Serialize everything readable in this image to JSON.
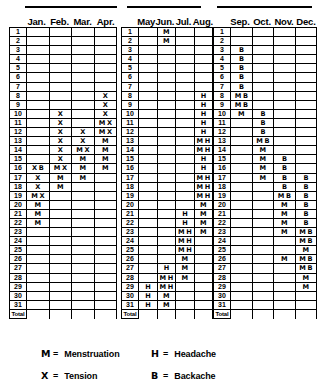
{
  "chart_data": {
    "type": "table",
    "xlabel": "Month",
    "ylabel": "Day of month",
    "grid": true,
    "legend_position": "bottom",
    "row_label_header": "",
    "total_row_label": "Total",
    "day_numbers": [
      "1",
      "2",
      "3",
      "4",
      "5",
      "6",
      "7",
      "8",
      "9",
      "10",
      "11",
      "12",
      "13",
      "14",
      "15",
      "16",
      "17",
      "18",
      "19",
      "20",
      "21",
      "22",
      "23",
      "24",
      "25",
      "26",
      "27",
      "28",
      "29",
      "30",
      "31"
    ],
    "symbols": {
      "menstruation": "M",
      "tension": "X",
      "headache": "H",
      "backache": "B"
    },
    "groups": [
      {
        "id": "group-jan-apr",
        "categories": [
          "Jan.",
          "Feb.",
          "Mar.",
          "Apr."
        ],
        "cells": [
          [
            "",
            "",
            "",
            ""
          ],
          [
            "",
            "",
            "",
            ""
          ],
          [
            "",
            "",
            "",
            ""
          ],
          [
            "",
            "",
            "",
            ""
          ],
          [
            "",
            "",
            "",
            ""
          ],
          [
            "",
            "",
            "",
            ""
          ],
          [
            "",
            "",
            "",
            ""
          ],
          [
            "",
            "",
            "",
            "X"
          ],
          [
            "",
            "",
            "",
            "X"
          ],
          [
            "",
            "X",
            "",
            "X"
          ],
          [
            "",
            "X",
            "",
            "M X"
          ],
          [
            "",
            "X",
            "X",
            "M X"
          ],
          [
            "",
            "X",
            "X",
            "M"
          ],
          [
            "",
            "X",
            "M X",
            "M"
          ],
          [
            "",
            "X",
            "M",
            "M"
          ],
          [
            "X B",
            "M X",
            "M",
            "M"
          ],
          [
            "X",
            "M",
            "M",
            ""
          ],
          [
            "X",
            "M",
            "",
            ""
          ],
          [
            "M X",
            "",
            "",
            ""
          ],
          [
            "M",
            "",
            "",
            ""
          ],
          [
            "M",
            "",
            "",
            ""
          ],
          [
            "M",
            "",
            "",
            ""
          ],
          [
            "",
            "",
            "",
            ""
          ],
          [
            "",
            "",
            "",
            ""
          ],
          [
            "",
            "",
            "",
            ""
          ],
          [
            "",
            "",
            "",
            ""
          ],
          [
            "",
            "",
            "",
            ""
          ],
          [
            "",
            "",
            "",
            ""
          ],
          [
            "",
            "",
            "",
            ""
          ],
          [
            "",
            "",
            "",
            ""
          ],
          [
            "",
            "",
            "",
            ""
          ]
        ],
        "totals": [
          "",
          "",
          "",
          ""
        ]
      },
      {
        "id": "group-may-aug",
        "categories": [
          "May",
          "Jun.",
          "Jul.",
          "Aug."
        ],
        "cells": [
          [
            "",
            "M",
            "",
            ""
          ],
          [
            "",
            "M",
            "",
            ""
          ],
          [
            "",
            "",
            "",
            ""
          ],
          [
            "",
            "",
            "",
            ""
          ],
          [
            "",
            "",
            "",
            ""
          ],
          [
            "",
            "",
            "",
            ""
          ],
          [
            "",
            "",
            "",
            ""
          ],
          [
            "",
            "",
            "",
            "H"
          ],
          [
            "",
            "",
            "",
            "H"
          ],
          [
            "",
            "",
            "",
            "H"
          ],
          [
            "",
            "",
            "",
            "H"
          ],
          [
            "",
            "",
            "",
            "H"
          ],
          [
            "",
            "",
            "",
            "M H"
          ],
          [
            "",
            "",
            "",
            "M H"
          ],
          [
            "",
            "",
            "",
            "H"
          ],
          [
            "",
            "",
            "",
            "H"
          ],
          [
            "",
            "",
            "",
            "M H"
          ],
          [
            "",
            "",
            "",
            "M H"
          ],
          [
            "",
            "",
            "",
            "M H"
          ],
          [
            "",
            "",
            "",
            "M"
          ],
          [
            "",
            "",
            "H",
            "M"
          ],
          [
            "",
            "",
            "H",
            "M"
          ],
          [
            "",
            "",
            "M H",
            "M"
          ],
          [
            "",
            "",
            "M H",
            ""
          ],
          [
            "",
            "",
            "M H",
            ""
          ],
          [
            "",
            "",
            "M",
            ""
          ],
          [
            "",
            "H",
            "M",
            ""
          ],
          [
            "",
            "M H",
            "M",
            ""
          ],
          [
            "H",
            "M H",
            "",
            ""
          ],
          [
            "H",
            "M",
            "",
            ""
          ],
          [
            "H",
            "M",
            "",
            ""
          ]
        ],
        "totals": [
          "",
          "",
          "",
          ""
        ]
      },
      {
        "id": "group-sep-dec",
        "categories": [
          "Sep.",
          "Oct.",
          "Nov.",
          "Dec."
        ],
        "cells": [
          [
            "",
            "",
            "",
            ""
          ],
          [
            "",
            "",
            "",
            ""
          ],
          [
            "B",
            "",
            "",
            ""
          ],
          [
            "B",
            "",
            "",
            ""
          ],
          [
            "B",
            "",
            "",
            ""
          ],
          [
            "B",
            "",
            "",
            ""
          ],
          [
            "B",
            "",
            "",
            ""
          ],
          [
            "M B",
            "",
            "",
            ""
          ],
          [
            "M B",
            "",
            "",
            ""
          ],
          [
            "M",
            "B",
            "",
            ""
          ],
          [
            "",
            "B",
            "",
            ""
          ],
          [
            "",
            "B",
            "",
            ""
          ],
          [
            "",
            "M B",
            "",
            ""
          ],
          [
            "",
            "M",
            "",
            ""
          ],
          [
            "",
            "M",
            "B",
            ""
          ],
          [
            "",
            "M",
            "B",
            ""
          ],
          [
            "",
            "M",
            "B",
            "B"
          ],
          [
            "",
            "",
            "B",
            "B"
          ],
          [
            "",
            "",
            "M B",
            "B"
          ],
          [
            "",
            "",
            "M",
            "B"
          ],
          [
            "",
            "",
            "M",
            "B"
          ],
          [
            "",
            "",
            "M",
            "B"
          ],
          [
            "",
            "",
            "M",
            "M B"
          ],
          [
            "",
            "",
            "",
            "M B"
          ],
          [
            "",
            "",
            "",
            "M"
          ],
          [
            "",
            "",
            "M",
            "M B"
          ],
          [
            "",
            "",
            "",
            "M B"
          ],
          [
            "",
            "",
            "",
            "M"
          ],
          [
            "",
            "",
            "",
            "M"
          ],
          [
            "",
            "",
            "",
            ""
          ],
          [
            "",
            "",
            "",
            ""
          ]
        ],
        "totals": [
          "",
          "",
          "",
          ""
        ]
      }
    ]
  },
  "legend": {
    "items": [
      {
        "symbol": "M",
        "eq": "=",
        "label": "Menstruation"
      },
      {
        "symbol": "H",
        "eq": "=",
        "label": "Headache"
      },
      {
        "symbol": "X",
        "eq": "=",
        "label": "Tension"
      },
      {
        "symbol": "B",
        "eq": "=",
        "label": "Backache"
      }
    ]
  }
}
